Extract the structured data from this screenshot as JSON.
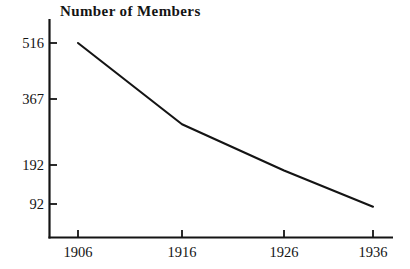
{
  "chart_data": {
    "type": "line",
    "title": "Number of Members",
    "xlabel": "",
    "ylabel": "",
    "x": [
      1906,
      1916,
      1926,
      1936
    ],
    "categories": [
      "1906",
      "1916",
      "1926",
      "1936"
    ],
    "values": [
      516,
      302,
      180,
      85
    ],
    "series": [
      {
        "name": "Number of Members",
        "values": [
          516,
          302,
          180,
          85
        ]
      }
    ],
    "x_tick_labels": [
      "1906",
      "1916",
      "1926",
      "1936"
    ],
    "y_tick_labels": [
      "516",
      "367",
      "192",
      "92"
    ],
    "y_tick_values": [
      516,
      367,
      192,
      92
    ],
    "xlim": [
      1906,
      1936
    ],
    "ylim": [
      0,
      560
    ],
    "grid": false,
    "legend": false,
    "line_color": "#141414",
    "background_color": "#ffffff",
    "axis_color": "#141414"
  },
  "axes": {
    "y_ticks": [
      {
        "label": "516",
        "value": 516
      },
      {
        "label": "367",
        "value": 367
      },
      {
        "label": "192",
        "value": 192
      },
      {
        "label": "92",
        "value": 92
      }
    ],
    "x_ticks": [
      {
        "label": "1906",
        "value": 1906
      },
      {
        "label": "1916",
        "value": 1916
      },
      {
        "label": "1926",
        "value": 1926
      },
      {
        "label": "1936",
        "value": 1936
      }
    ]
  }
}
